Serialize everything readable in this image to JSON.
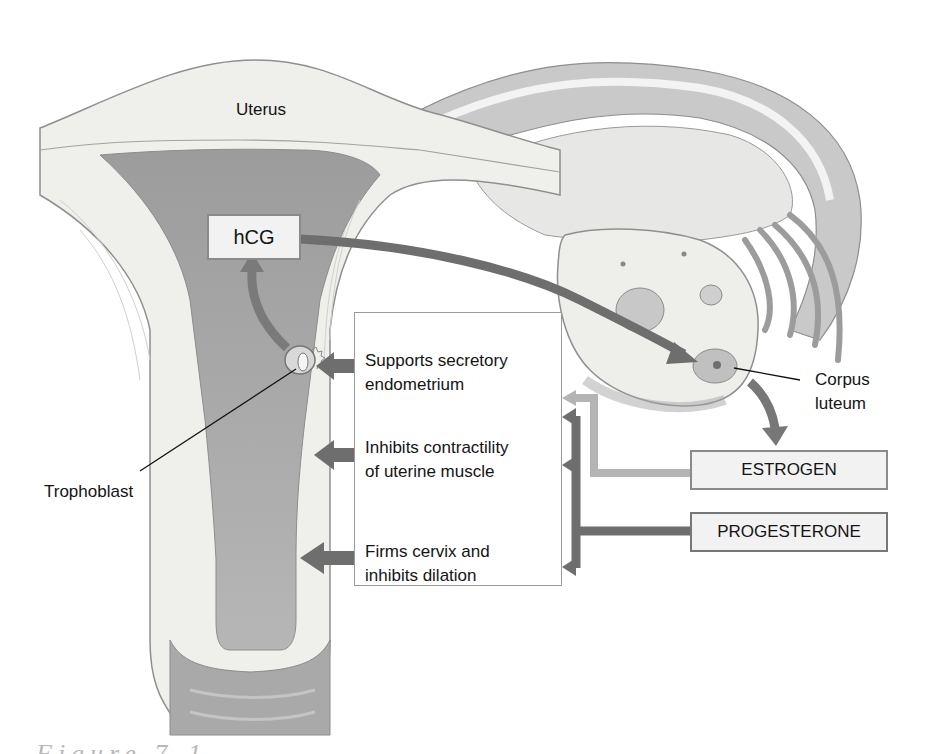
{
  "diagram": {
    "type": "anatomical-hormone-flow",
    "labels": {
      "uterus": "Uterus",
      "trophoblast": "Trophoblast",
      "corpus_luteum_line1": "Corpus",
      "corpus_luteum_line2": "luteum"
    },
    "hormones": {
      "hcg": "hCG",
      "estrogen": "ESTROGEN",
      "progesterone": "PROGESTERONE"
    },
    "effects": [
      {
        "line1": "Supports secretory",
        "line2": "endometrium"
      },
      {
        "line1": "Inhibits contractility",
        "line2": "of uterine muscle"
      },
      {
        "line1": "Firms cervix and",
        "line2": "inhibits dilation"
      }
    ],
    "caption_partial": "Figure 7-1",
    "colors": {
      "arrow_dark": "#6e6e6e",
      "arrow_light": "#b4b4b4",
      "tissue_light": "#eeeeea",
      "cavity": "#a8a8a8",
      "box_fill": "#f2f2f2",
      "box_border": "#8a8a8a"
    }
  }
}
